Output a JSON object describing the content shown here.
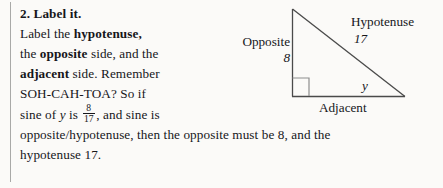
{
  "page": {
    "background_color": "#fbfaf8",
    "text_color": "#16161a",
    "rule_color": "#a9a9a7"
  },
  "heading": {
    "text": "2. Label it."
  },
  "body": {
    "line1_a": "Label the ",
    "line1_b": "hypotenuse,",
    "line2_a": "the ",
    "line2_b": "opposite",
    "line2_c": " side, and the",
    "line3_a": "adjacent",
    "line3_b": " side. Remember",
    "line4": "SOH-CAH-TOA? So if",
    "line5_a": "sine of ",
    "line5_b": "y",
    "line5_c": " is ",
    "line5_num": "8",
    "line5_den": "17",
    "line5_d": ", and sine is",
    "line6": "opposite/hypotenuse, then the opposite must be 8, and the",
    "line7": "hypotenuse 17."
  },
  "figure": {
    "name": "right-triangle-diagram",
    "stroke_color": "#4a4a4a",
    "labels": {
      "opposite": "Opposite",
      "opposite_value": "8",
      "hypotenuse": "Hypotenuse",
      "hypotenuse_value": "17",
      "adjacent": "Adjacent",
      "angle": "y"
    },
    "geometry": {
      "apex": [
        72,
        9
      ],
      "bottom_left": [
        72,
        96
      ],
      "bottom_right": [
        185,
        96
      ],
      "right_angle_marker": [
        72,
        78,
        16,
        18
      ]
    }
  }
}
